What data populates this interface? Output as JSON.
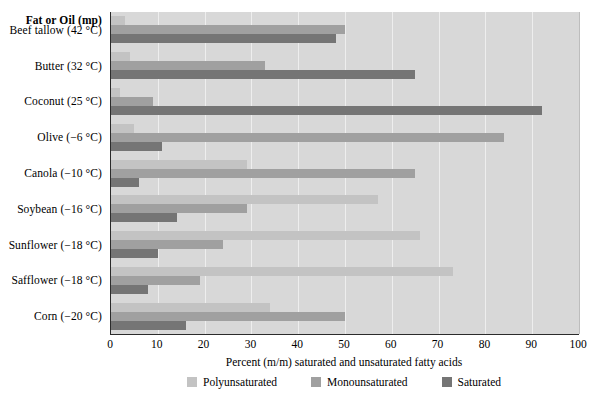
{
  "chart_data": {
    "type": "bar",
    "orientation": "horizontal",
    "title": "",
    "column_header": "Fat or Oil (mp)",
    "xlabel": "Percent (m/m) saturated and unsaturated fatty acids",
    "ylabel": "",
    "xlim": [
      0,
      100
    ],
    "xticks": [
      0,
      10,
      20,
      30,
      40,
      50,
      60,
      70,
      80,
      90,
      100
    ],
    "grid": true,
    "legend_position": "bottom",
    "categories": [
      "Beef tallow (42 °C)",
      "Butter (32 °C)",
      "Coconut (25 °C)",
      "Olive (−6 °C)",
      "Canola (−10 °C)",
      "Soybean (−16 °C)",
      "Sunflower (−18 °C)",
      "Safflower (−18 °C)",
      "Corn (−20 °C)"
    ],
    "series": [
      {
        "name": "Polyunsaturated",
        "color": "#c3c3c3",
        "values": [
          3,
          4,
          2,
          5,
          29,
          57,
          66,
          73,
          34
        ]
      },
      {
        "name": "Monounsaturated",
        "color": "#a0a0a0",
        "values": [
          50,
          33,
          9,
          84,
          65,
          29,
          24,
          19,
          50
        ]
      },
      {
        "name": "Saturated",
        "color": "#757575",
        "values": [
          48,
          65,
          92,
          11,
          6,
          14,
          10,
          8,
          16
        ]
      }
    ]
  },
  "axis": {
    "tick_labels": [
      "0",
      "10",
      "20",
      "30",
      "40",
      "50",
      "60",
      "70",
      "80",
      "90",
      "100"
    ],
    "title": "Percent (m/m) saturated and unsaturated fatty acids"
  },
  "colors": {
    "plot_background": "#d8d8d8",
    "gridline": "#eeeeee",
    "axis_line": "#2b2b2b",
    "polyunsaturated": "#c3c3c3",
    "monounsaturated": "#a0a0a0",
    "saturated": "#757575"
  }
}
